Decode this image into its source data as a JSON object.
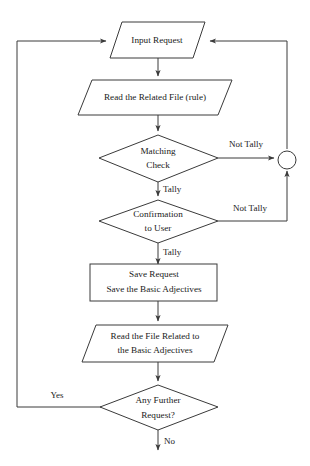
{
  "diagram": {
    "background_color": "#ffffff",
    "line_color": "#3a3a3a",
    "text_color": "#1a1a1a",
    "nodes": [
      {
        "id": "input-request",
        "shape": "parallelogram",
        "lines": [
          "Input Request"
        ]
      },
      {
        "id": "read-related-file",
        "shape": "parallelogram",
        "lines": [
          "Read the Related File (rule)"
        ]
      },
      {
        "id": "matching-check",
        "shape": "diamond",
        "lines": [
          "Matching",
          "Check"
        ]
      },
      {
        "id": "confirmation-to-user",
        "shape": "diamond",
        "lines": [
          "Confirmation",
          "to User"
        ]
      },
      {
        "id": "save-request",
        "shape": "rectangle",
        "lines": [
          "Save Request",
          "Save the Basic Adjectives"
        ]
      },
      {
        "id": "read-file-basic-adjectives",
        "shape": "parallelogram",
        "lines": [
          "Read the File Related to",
          "the Basic Adjectives"
        ]
      },
      {
        "id": "any-further-request",
        "shape": "diamond",
        "lines": [
          "Any Further",
          "Request?"
        ]
      },
      {
        "id": "merge-connector",
        "shape": "circle",
        "lines": []
      }
    ],
    "edge_labels": {
      "matching_not_tally": "Not Tally",
      "matching_tally": "Tally",
      "confirmation_not_tally": "Not Tally",
      "confirmation_tally": "Tally",
      "further_yes": "Yes",
      "further_no": "No"
    }
  }
}
